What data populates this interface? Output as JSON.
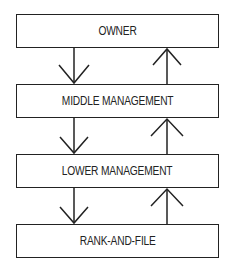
{
  "diagram": {
    "type": "hierarchy-flow",
    "levels": [
      {
        "label": "OWNER"
      },
      {
        "label": "MIDDLE MANAGEMENT"
      },
      {
        "label": "LOWER MANAGEMENT"
      },
      {
        "label": "RANK-AND-FILE"
      }
    ],
    "arrows": [
      {
        "from": "OWNER",
        "to": "MIDDLE MANAGEMENT",
        "direction": "down"
      },
      {
        "from": "MIDDLE MANAGEMENT",
        "to": "OWNER",
        "direction": "up"
      },
      {
        "from": "MIDDLE MANAGEMENT",
        "to": "LOWER MANAGEMENT",
        "direction": "down"
      },
      {
        "from": "LOWER MANAGEMENT",
        "to": "MIDDLE MANAGEMENT",
        "direction": "up"
      },
      {
        "from": "LOWER MANAGEMENT",
        "to": "RANK-AND-FILE",
        "direction": "down"
      },
      {
        "from": "RANK-AND-FILE",
        "to": "LOWER MANAGEMENT",
        "direction": "up"
      }
    ]
  }
}
